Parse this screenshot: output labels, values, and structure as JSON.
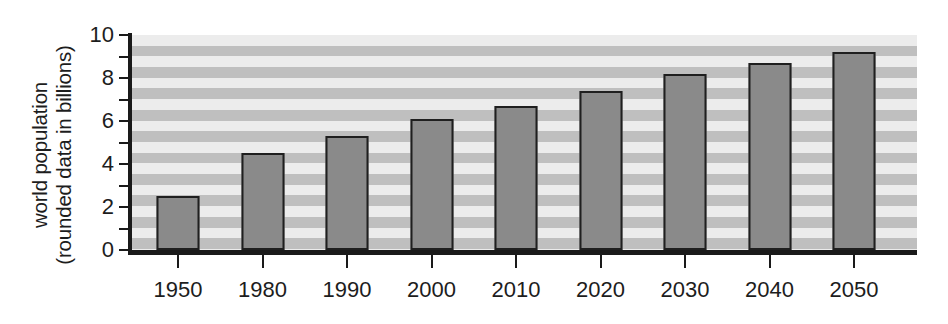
{
  "chart_data": {
    "type": "bar",
    "title": "",
    "xlabel": "",
    "ylabel_line1": "world population",
    "ylabel_line2": "(rounded data in billions)",
    "categories": [
      "1950",
      "1980",
      "1990",
      "2000",
      "2010",
      "2020",
      "2030",
      "2040",
      "2050"
    ],
    "values": [
      2.5,
      4.5,
      5.3,
      6.1,
      6.7,
      7.4,
      8.2,
      8.7,
      9.2
    ],
    "ylim": [
      0,
      10
    ],
    "ytick_labels": [
      "0",
      "2",
      "4",
      "6",
      "8",
      "10"
    ],
    "ytick_values": [
      0,
      2,
      4,
      6,
      8,
      10
    ],
    "yminor_values": [
      1,
      3,
      5,
      7,
      9
    ],
    "grid": "horizontal-banded",
    "legend": "none",
    "colors": {
      "bar_fill": "#8a8a8a",
      "bar_edge": "#1f1f1f",
      "axis": "#1a1a1a",
      "band_light": "#ececec",
      "band_dark": "#bfbfbf",
      "text": "#1d1d1d",
      "background": "#ffffff"
    }
  }
}
